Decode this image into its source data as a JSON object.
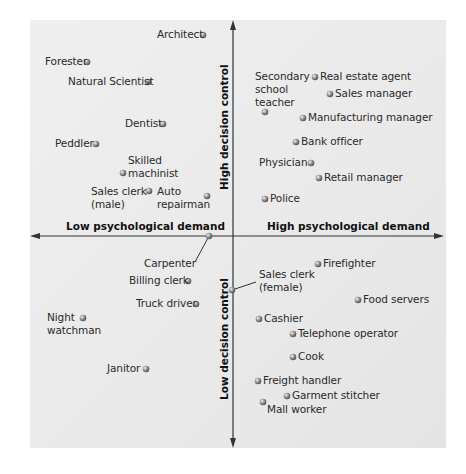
{
  "chart_data": {
    "type": "scatter",
    "title": "",
    "xlabel_left": "Low psychological demand",
    "xlabel_right": "High psychological demand",
    "ylabel_top": "High decision control",
    "ylabel_bottom": "Low decision control",
    "axis_origin_px": [
      233,
      236
    ],
    "grid": false,
    "points": [
      {
        "name": "Architect",
        "x": 203,
        "y": 35,
        "lx": 157,
        "ly": 28,
        "align": "left"
      },
      {
        "name": "Forester",
        "x": 87,
        "y": 62,
        "lx": 45,
        "ly": 55
      },
      {
        "name": "Natural Scientist",
        "x": 148,
        "y": 82,
        "lx": 68,
        "ly": 75
      },
      {
        "name": "Dentist",
        "x": 163,
        "y": 124,
        "lx": 125,
        "ly": 117
      },
      {
        "name": "Peddler",
        "x": 96,
        "y": 144,
        "lx": 55,
        "ly": 137
      },
      {
        "name": "Skilled\nmachinist",
        "x": 123,
        "y": 173,
        "lx": 128,
        "ly": 154
      },
      {
        "name": "Sales clerk\n(male)",
        "x": 149,
        "y": 191,
        "lx": 91,
        "ly": 185
      },
      {
        "name": "Auto\nrepairman",
        "x": 207,
        "y": 196,
        "lx": 157,
        "ly": 185
      },
      {
        "name": "Carpenter",
        "x": 209,
        "y": 236,
        "lx": 144,
        "ly": 257,
        "leader": [
          195,
          262
        ]
      },
      {
        "name": "Billing clerk",
        "x": 188,
        "y": 281,
        "lx": 129,
        "ly": 274
      },
      {
        "name": "Truck driver",
        "x": 196,
        "y": 304,
        "lx": 136,
        "ly": 297
      },
      {
        "name": "Night\nwatchman",
        "x": 83,
        "y": 318,
        "lx": 47,
        "ly": 311
      },
      {
        "name": "Janitor",
        "x": 146,
        "y": 369,
        "lx": 107,
        "ly": 362
      },
      {
        "name": "Secondary\nschool\nteacher",
        "x": 265,
        "y": 112,
        "lx": 255,
        "ly": 70
      },
      {
        "name": "Real estate agent",
        "x": 315,
        "y": 77,
        "lx": 320,
        "ly": 70
      },
      {
        "name": "Sales manager",
        "x": 330,
        "y": 94,
        "lx": 335,
        "ly": 87
      },
      {
        "name": "Manufacturing manager",
        "x": 303,
        "y": 118,
        "lx": 308,
        "ly": 111
      },
      {
        "name": "Bank officer",
        "x": 296,
        "y": 142,
        "lx": 301,
        "ly": 135
      },
      {
        "name": "Physician",
        "x": 311,
        "y": 163,
        "lx": 259,
        "ly": 156
      },
      {
        "name": "Retail manager",
        "x": 319,
        "y": 178,
        "lx": 324,
        "ly": 171
      },
      {
        "name": "Police",
        "x": 265,
        "y": 199,
        "lx": 270,
        "ly": 192
      },
      {
        "name": "Firefighter",
        "x": 318,
        "y": 264,
        "lx": 323,
        "ly": 257
      },
      {
        "name": "Sales clerk\n(female)",
        "x": 232,
        "y": 290,
        "lx": 259,
        "ly": 268,
        "leader": [
          256,
          282
        ]
      },
      {
        "name": "Food servers",
        "x": 358,
        "y": 300,
        "lx": 363,
        "ly": 293
      },
      {
        "name": "Cashier",
        "x": 259,
        "y": 319,
        "lx": 264,
        "ly": 312
      },
      {
        "name": "Telephone operator",
        "x": 293,
        "y": 334,
        "lx": 298,
        "ly": 327
      },
      {
        "name": "Cook",
        "x": 293,
        "y": 357,
        "lx": 298,
        "ly": 350
      },
      {
        "name": "Freight handler",
        "x": 258,
        "y": 381,
        "lx": 263,
        "ly": 374
      },
      {
        "name": "Garment stitcher",
        "x": 287,
        "y": 396,
        "lx": 292,
        "ly": 389
      },
      {
        "name": "Mall worker",
        "x": 263,
        "y": 402,
        "lx": 267,
        "ly": 403
      }
    ]
  },
  "axes": {
    "low_demand": "Low psychological demand",
    "high_demand": "High psychological demand",
    "high_control": "High decision control",
    "low_control": "Low decision control"
  },
  "colors": {
    "panel": "#ebebeb",
    "axis": "#333333",
    "dot": "#888888",
    "text": "#2a2a2a"
  }
}
